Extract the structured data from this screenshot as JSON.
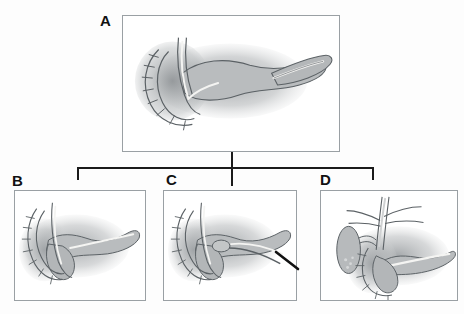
{
  "figure": {
    "type": "medical-illustration",
    "background_color": "#fdfdfd",
    "panel_border_color": "#9aa0a4",
    "connector_color": "#1b1b1b",
    "organ_fill_color": "#b9bcbe",
    "organ_outline_color": "#5b6165",
    "duct_highlight_color": "#f4f4f2",
    "marker_color": "#111111"
  },
  "panels": [
    {
      "id": "A",
      "label": "A",
      "label_x": 100,
      "label_y": 13,
      "x": 122,
      "y": 15,
      "width": 218,
      "height": 137,
      "role": "parent"
    },
    {
      "id": "B",
      "label": "B",
      "label_x": 12,
      "label_y": 173,
      "x": 14,
      "y": 190,
      "width": 132,
      "height": 111,
      "role": "variant"
    },
    {
      "id": "C",
      "label": "C",
      "label_x": 166,
      "label_y": 172,
      "x": 163,
      "y": 190,
      "width": 134,
      "height": 111,
      "role": "variant"
    },
    {
      "id": "D",
      "label": "D",
      "label_x": 320,
      "label_y": 172,
      "x": 320,
      "y": 190,
      "width": 138,
      "height": 111,
      "role": "variant"
    }
  ],
  "connector": {
    "stem_x": 231,
    "stem_top": 152,
    "stem_bottom": 186,
    "bar_y": 167,
    "bar_left": 77,
    "bar_right": 373,
    "stub_left_x": 77,
    "stub_right_x": 372,
    "stub_top": 167,
    "stub_bottom": 180
  }
}
